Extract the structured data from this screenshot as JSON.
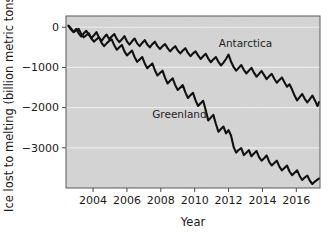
{
  "chart_data": {
    "type": "line",
    "title": "",
    "subtitle": "",
    "xlabel": "Year",
    "ylabel": "Ice lost to melting (billion metric tons)",
    "xlim": [
      2002.4,
      2017.4
    ],
    "ylim": [
      -4000,
      280
    ],
    "xticks": [
      2004,
      2006,
      2008,
      2010,
      2012,
      2014,
      2016
    ],
    "xtick_labels": [
      "2004",
      "2006",
      "2008",
      "2010",
      "2012",
      "2014",
      "2016"
    ],
    "yticks": [
      0,
      -1000,
      -2000,
      -3000
    ],
    "ytick_labels": [
      "0",
      "−1000",
      "−2000",
      "−3000"
    ],
    "grid": "horizontal-white-faint",
    "legend_position": "inline-annotations",
    "plot_background_color": "#d4d4d4",
    "figure_background_color": "#ffffff",
    "line_color": "#111111",
    "grid_color": "#f0f0f0",
    "axis_color": "#4a4a4a",
    "annotations": [
      {
        "text": "Antarctica",
        "x": 2013.0,
        "y": -480
      },
      {
        "text": "Greenland",
        "x": 2009.1,
        "y": -2260
      }
    ],
    "series": [
      {
        "name": "Antarctica",
        "color": "#111111",
        "x": [
          2002.55,
          2002.7,
          2002.85,
          2003.0,
          2003.15,
          2003.3,
          2003.45,
          2003.6,
          2003.75,
          2003.9,
          2004.05,
          2004.2,
          2004.35,
          2004.5,
          2004.65,
          2004.8,
          2004.95,
          2005.1,
          2005.25,
          2005.4,
          2005.55,
          2005.7,
          2005.85,
          2006.0,
          2006.15,
          2006.3,
          2006.45,
          2006.6,
          2006.75,
          2006.9,
          2007.05,
          2007.2,
          2007.35,
          2007.5,
          2007.65,
          2007.8,
          2007.95,
          2008.1,
          2008.25,
          2008.4,
          2008.55,
          2008.7,
          2008.85,
          2009.0,
          2009.15,
          2009.3,
          2009.45,
          2009.6,
          2009.75,
          2009.9,
          2010.05,
          2010.2,
          2010.35,
          2010.5,
          2010.65,
          2010.8,
          2010.95,
          2011.1,
          2011.25,
          2011.4,
          2011.55,
          2011.7,
          2011.85,
          2012.0,
          2012.15,
          2012.3,
          2012.45,
          2012.6,
          2012.75,
          2012.9,
          2013.05,
          2013.2,
          2013.35,
          2013.5,
          2013.65,
          2013.8,
          2013.95,
          2014.1,
          2014.25,
          2014.4,
          2014.55,
          2014.7,
          2014.85,
          2015.0,
          2015.15,
          2015.3,
          2015.45,
          2015.6,
          2015.75,
          2015.9,
          2016.05,
          2016.2,
          2016.35,
          2016.5,
          2016.65,
          2016.8,
          2016.95,
          2017.1,
          2017.25,
          2017.35
        ],
        "values": [
          30,
          -60,
          -120,
          -40,
          -150,
          -230,
          -150,
          -90,
          -190,
          -270,
          -200,
          -120,
          -260,
          -340,
          -250,
          -180,
          -300,
          -230,
          -170,
          -290,
          -370,
          -300,
          -220,
          -350,
          -430,
          -350,
          -280,
          -400,
          -470,
          -390,
          -320,
          -430,
          -500,
          -420,
          -360,
          -470,
          -540,
          -470,
          -420,
          -520,
          -600,
          -530,
          -470,
          -580,
          -650,
          -580,
          -520,
          -640,
          -720,
          -650,
          -600,
          -700,
          -790,
          -720,
          -660,
          -780,
          -870,
          -800,
          -740,
          -860,
          -950,
          -880,
          -790,
          -680,
          -860,
          -990,
          -1080,
          -1010,
          -940,
          -1060,
          -1150,
          -1080,
          -1010,
          -1130,
          -1230,
          -1160,
          -1090,
          -1190,
          -1290,
          -1220,
          -1160,
          -1280,
          -1380,
          -1310,
          -1250,
          -1370,
          -1480,
          -1420,
          -1550,
          -1700,
          -1820,
          -1740,
          -1660,
          -1780,
          -1870,
          -1790,
          -1700,
          -1820,
          -1960,
          -1860
        ]
      },
      {
        "name": "Greenland",
        "color": "#111111",
        "x": [
          2002.55,
          2002.7,
          2002.85,
          2003.0,
          2003.15,
          2003.3,
          2003.45,
          2003.6,
          2003.75,
          2003.9,
          2004.05,
          2004.2,
          2004.35,
          2004.5,
          2004.65,
          2004.8,
          2004.95,
          2005.1,
          2005.25,
          2005.4,
          2005.55,
          2005.7,
          2005.85,
          2006.0,
          2006.15,
          2006.3,
          2006.45,
          2006.6,
          2006.75,
          2006.9,
          2007.05,
          2007.2,
          2007.35,
          2007.5,
          2007.65,
          2007.8,
          2007.95,
          2008.1,
          2008.25,
          2008.4,
          2008.55,
          2008.7,
          2008.85,
          2009.0,
          2009.15,
          2009.3,
          2009.45,
          2009.6,
          2009.75,
          2009.9,
          2010.05,
          2010.2,
          2010.35,
          2010.5,
          2010.65,
          2010.8,
          2010.95,
          2011.1,
          2011.25,
          2011.4,
          2011.55,
          2011.7,
          2011.85,
          2012.0,
          2012.15,
          2012.3,
          2012.45,
          2012.6,
          2012.75,
          2012.9,
          2013.05,
          2013.2,
          2013.35,
          2013.5,
          2013.65,
          2013.8,
          2013.95,
          2014.1,
          2014.25,
          2014.4,
          2014.55,
          2014.7,
          2014.85,
          2015.0,
          2015.15,
          2015.3,
          2015.45,
          2015.6,
          2015.75,
          2015.9,
          2016.05,
          2016.2,
          2016.35,
          2016.5,
          2016.65,
          2016.8,
          2016.95,
          2017.1,
          2017.25,
          2017.35
        ],
        "values": [
          40,
          -30,
          -120,
          -80,
          -40,
          -170,
          -250,
          -200,
          -150,
          -280,
          -360,
          -300,
          -250,
          -390,
          -470,
          -400,
          -340,
          -300,
          -450,
          -560,
          -500,
          -440,
          -600,
          -700,
          -640,
          -580,
          -740,
          -860,
          -800,
          -740,
          -900,
          -1020,
          -960,
          -900,
          -1070,
          -1200,
          -1140,
          -1080,
          -1260,
          -1400,
          -1330,
          -1270,
          -1440,
          -1560,
          -1500,
          -1440,
          -1620,
          -1760,
          -1690,
          -1630,
          -1820,
          -1960,
          -1890,
          -1830,
          -2060,
          -2320,
          -2250,
          -2180,
          -2400,
          -2600,
          -2530,
          -2470,
          -2640,
          -2560,
          -2700,
          -2980,
          -3120,
          -3050,
          -3010,
          -3180,
          -3120,
          -3060,
          -3210,
          -3140,
          -3080,
          -3230,
          -3320,
          -3260,
          -3190,
          -3350,
          -3440,
          -3380,
          -3320,
          -3470,
          -3560,
          -3500,
          -3440,
          -3590,
          -3680,
          -3620,
          -3560,
          -3700,
          -3800,
          -3740,
          -3690,
          -3820,
          -3900,
          -3840,
          -3790,
          -3760
        ]
      }
    ]
  },
  "accessibility": {
    "chart_role": "scientific-line-chart",
    "panel_name": "ice-loss-chart"
  }
}
